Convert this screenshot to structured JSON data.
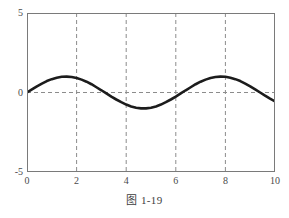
{
  "figure": {
    "caption": "图 1-19",
    "background_color": "#ffffff"
  },
  "chart_data": {
    "type": "line",
    "title": "",
    "xlabel": "",
    "ylabel": "",
    "xlim": [
      0,
      10
    ],
    "ylim": [
      -5,
      5
    ],
    "grid": true,
    "grid_style": "dashed",
    "grid_color": "#8c8c8c",
    "legend": null,
    "legend_position": "none",
    "x_ticks": [
      0,
      2,
      4,
      6,
      8,
      10
    ],
    "x_tick_labels": [
      "0",
      "2",
      "4",
      "6",
      "8",
      "10"
    ],
    "y_ticks": [
      -5,
      0,
      5
    ],
    "y_tick_labels": [
      "-5",
      "0",
      "5"
    ],
    "x_gridlines": [
      2,
      4,
      6,
      8
    ],
    "y_gridlines": [
      0
    ],
    "frame_color": "#7a7a7a",
    "series": [
      {
        "name": "sine wave",
        "color": "#1c1c1c",
        "line_width": 2.6,
        "style": "dense-markers",
        "description": "amplitude 1 sinusoid, period about 6.2, starting at 0 and rising",
        "x": [
          0,
          0.2,
          0.4,
          0.6,
          0.8,
          1.0,
          1.2,
          1.4,
          1.6,
          1.8,
          2.0,
          2.2,
          2.4,
          2.6,
          2.8,
          3.0,
          3.2,
          3.4,
          3.6,
          3.8,
          4.0,
          4.2,
          4.4,
          4.6,
          4.8,
          5.0,
          5.2,
          5.4,
          5.6,
          5.8,
          6.0,
          6.2,
          6.4,
          6.6,
          6.8,
          7.0,
          7.2,
          7.4,
          7.6,
          7.8,
          8.0,
          8.2,
          8.4,
          8.6,
          8.8,
          9.0,
          9.2,
          9.4,
          9.6,
          9.8,
          10.0
        ],
        "y": [
          0.0,
          0.2,
          0.39,
          0.56,
          0.72,
          0.84,
          0.93,
          0.99,
          1.0,
          0.97,
          0.91,
          0.81,
          0.68,
          0.52,
          0.33,
          0.14,
          -0.06,
          -0.26,
          -0.44,
          -0.61,
          -0.76,
          -0.88,
          -0.96,
          -1.0,
          -1.0,
          -0.96,
          -0.88,
          -0.76,
          -0.61,
          -0.44,
          -0.26,
          -0.06,
          0.14,
          0.33,
          0.52,
          0.68,
          0.81,
          0.91,
          0.97,
          1.0,
          0.99,
          0.93,
          0.84,
          0.72,
          0.56,
          0.39,
          0.2,
          0.0,
          -0.2,
          -0.39,
          -0.56
        ]
      }
    ]
  }
}
